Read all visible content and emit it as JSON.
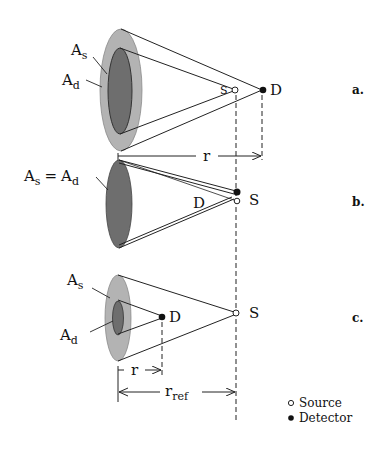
{
  "figure": {
    "panels": [
      {
        "id": "a",
        "label": "a.",
        "labels": {
          "source_area": "A",
          "source_area_sub": "s",
          "detector_area": "A",
          "detector_area_sub": "d",
          "source": "S",
          "detector": "D",
          "distance": "r"
        }
      },
      {
        "id": "b",
        "label": "b.",
        "labels": {
          "equal_area_lhs": "A",
          "equal_area_lhs_sub": "s",
          "equal_sign": "=",
          "equal_area_rhs": "A",
          "equal_area_rhs_sub": "d",
          "source": "S",
          "detector": "D"
        }
      },
      {
        "id": "c",
        "label": "c.",
        "labels": {
          "source_area": "A",
          "source_area_sub": "s",
          "detector_area": "A",
          "detector_area_sub": "d",
          "source": "S",
          "detector": "D",
          "distance": "r",
          "ref_distance": "r",
          "ref_distance_sub": "ref"
        }
      }
    ],
    "legend": [
      {
        "symbol": "open-circle",
        "label": "Source"
      },
      {
        "symbol": "filled-circle",
        "label": "Detector"
      }
    ],
    "colors": {
      "outer_area": "#b3b3b3",
      "inner_area": "#6e6e6e",
      "line": "#222222"
    }
  }
}
